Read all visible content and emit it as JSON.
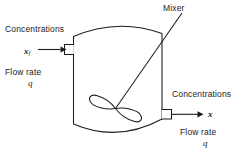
{
  "diagram": {
    "stroke_color": "#1c1c1c",
    "background_color": "#ffffff",
    "labels": {
      "mixer": "Mixer",
      "concentrations_in": "Concentrations",
      "inlet_symbol": "x",
      "inlet_symbol_subscript": "f",
      "flow_rate_in": "Flow rate",
      "flow_rate_in_symbol": "q",
      "concentrations_out": "Concentrations",
      "outlet_symbol": "x",
      "flow_rate_out": "Flow rate",
      "flow_rate_out_symbol": "q"
    },
    "elements": {
      "tank": "tank-vessel-outline",
      "inlet_nozzle": "inlet-nozzle",
      "outlet_nozzle": "outlet-nozzle",
      "inlet_arrow": "inlet-flow-arrow",
      "outlet_arrow": "outlet-flow-arrow",
      "impeller": "impeller-blades",
      "shaft": "mixer-shaft-line"
    }
  }
}
